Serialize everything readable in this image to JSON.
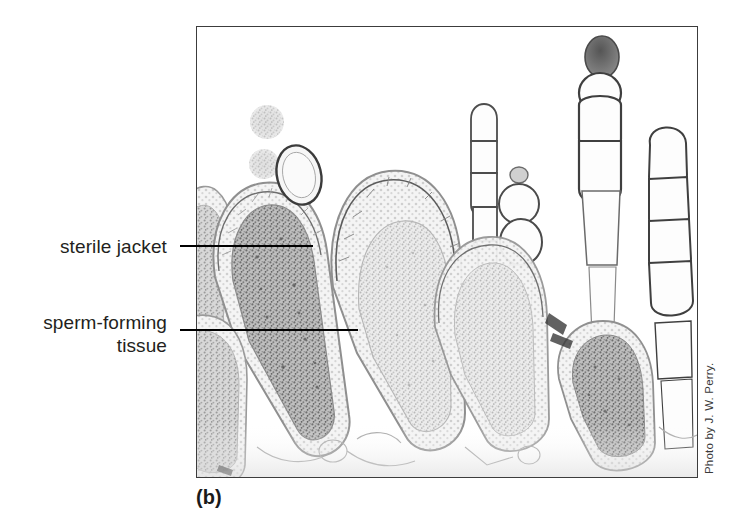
{
  "figure": {
    "panel_letter": "(b)",
    "photo_credit": "Photo by J. W. Perry.",
    "background_color": "#ffffff",
    "frame_color": "#3c3c3c",
    "leader_line_color": "#000000",
    "text_color": "#231f20"
  },
  "callouts": [
    {
      "id": "sterile-jacket",
      "label": "sterile jacket",
      "leader_from_x": 180,
      "leader_to_x": 313,
      "leader_y": 245
    },
    {
      "id": "sperm-forming-tissue",
      "label": "sperm-forming\ntissue",
      "leader_from_x": 180,
      "leader_to_x": 358,
      "leader_y": 329
    }
  ],
  "micrograph": {
    "description": "Light micrograph of a longitudinal section through a moss antheridial head showing club-shaped antheridia with a single-cell-thick sterile jacket enclosing dense granular sperm-forming tissue, interspersed with multicellular filamentous paraphyses.",
    "x": 196,
    "y": 26,
    "width": 500,
    "height": 450,
    "stain_tone": "grayscale",
    "structures": [
      {
        "name": "antheridium",
        "count": 6
      },
      {
        "name": "paraphysis",
        "count": 5
      },
      {
        "name": "released-sperm-mass",
        "count": 2
      }
    ]
  }
}
